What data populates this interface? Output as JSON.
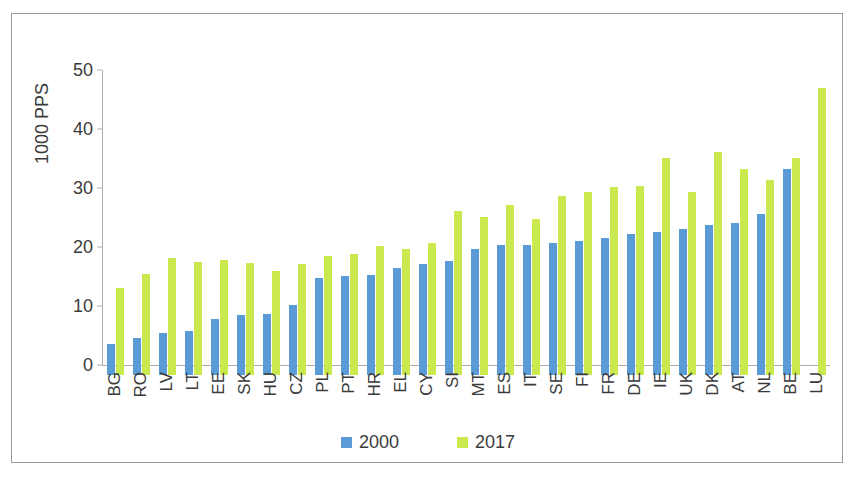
{
  "chart_data": {
    "type": "bar",
    "title": "",
    "xlabel": "",
    "ylabel": "1000 PPS",
    "ylim": [
      0,
      50
    ],
    "yticks": [
      0,
      10,
      20,
      30,
      40,
      50
    ],
    "grid": false,
    "legend_position": "bottom",
    "categories": [
      "BG",
      "RO",
      "LV",
      "LT",
      "EE",
      "SK",
      "HU",
      "CZ",
      "PL",
      "PT",
      "HR",
      "EL",
      "CY",
      "SI",
      "MT",
      "ES",
      "IT",
      "SE",
      "FI",
      "FR",
      "DE",
      "IE",
      "UK",
      "DK",
      "AT",
      "NL",
      "BE",
      "LU"
    ],
    "series": [
      {
        "name": "2000",
        "color": "#5b9bd5",
        "values": [
          5.3,
          6.2,
          7.1,
          7.4,
          9.5,
          10.1,
          10.4,
          11.8,
          16.4,
          16.8,
          17.0,
          18.2,
          18.8,
          19.3,
          21.3,
          22.0,
          22.1,
          22.4,
          22.7,
          23.2,
          23.9,
          24.3,
          24.8,
          25.4,
          25.8,
          27.3,
          35.0,
          0.0
        ]
      },
      {
        "name": "2017",
        "color": "#c9e94f",
        "values": [
          14.7,
          17.1,
          19.8,
          19.2,
          19.5,
          19.0,
          17.7,
          18.9,
          20.2,
          20.5,
          21.9,
          21.4,
          22.3,
          27.8,
          26.7,
          28.8,
          26.5,
          30.4,
          31.0,
          31.8,
          32.1,
          36.7,
          31.1,
          37.8,
          34.9,
          33.1,
          36.7,
          48.6
        ]
      }
    ]
  },
  "legend": {
    "items": [
      {
        "label": "2000",
        "color": "#5b9bd5"
      },
      {
        "label": "2017",
        "color": "#c9e94f"
      }
    ]
  }
}
